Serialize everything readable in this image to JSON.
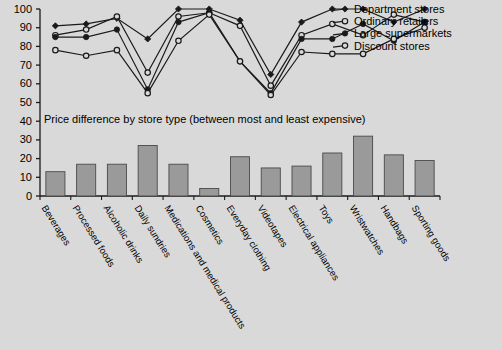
{
  "chart_data": {
    "type": "line",
    "title": "",
    "xlabel": "",
    "ylabel": "",
    "ylim": [
      0,
      100
    ],
    "yticks": [
      0,
      10,
      20,
      30,
      40,
      50,
      60,
      70,
      80,
      90,
      100
    ],
    "grid": false,
    "legend_position": "top-right",
    "categories": [
      "Beverages",
      "Processed foods",
      "Alcoholic drinks",
      "Daily sundries",
      "Medications and medical products",
      "Cosmetics",
      "Everyday clothing",
      "Videotapes",
      "Electrical appliances",
      "Toys",
      "Wristwatches",
      "Handbags",
      "Sporting goods"
    ],
    "series": [
      {
        "name": "Department stores",
        "marker": "filled-diamond",
        "values": [
          91,
          92,
          95,
          84,
          100,
          100,
          94,
          65,
          93,
          100,
          100,
          93,
          100
        ]
      },
      {
        "name": "Ordinary retailers",
        "marker": "open-circle",
        "values": [
          86,
          89,
          96,
          66,
          96,
          98,
          91,
          59,
          86,
          92,
          86,
          97,
          93
        ]
      },
      {
        "name": "Large supermarkets",
        "marker": "filled-circle",
        "values": [
          85,
          85,
          89,
          57,
          93,
          98,
          72,
          55,
          84,
          84,
          92,
          83,
          93
        ]
      },
      {
        "name": "Discount stores",
        "marker": "open-circle",
        "values": [
          78,
          75,
          78,
          55,
          83,
          97,
          72,
          54,
          77,
          76,
          76,
          84,
          90
        ]
      }
    ]
  },
  "bar_chart": {
    "type": "bar",
    "title": "Price difference by store type (between most and least expensive)",
    "ylim": [
      0,
      100
    ],
    "categories": [
      "Beverages",
      "Processed foods",
      "Alcoholic drinks",
      "Daily sundries",
      "Medications and medical products",
      "Cosmetics",
      "Everyday clothing",
      "Videotapes",
      "Electrical appliances",
      "Toys",
      "Wristwatches",
      "Handbags",
      "Sporting goods"
    ],
    "values": [
      13,
      17,
      17,
      27,
      17,
      4,
      21,
      15,
      16,
      23,
      32,
      22,
      19
    ]
  },
  "axis": {
    "ytick_labels": [
      "100",
      "90",
      "80",
      "70",
      "60",
      "50",
      "40",
      "30",
      "20",
      "10",
      "0"
    ]
  },
  "legend": {
    "items": [
      {
        "label": "Department stores",
        "marker": "filled-diamond"
      },
      {
        "label": "Ordinary retailers",
        "marker": "open-circle"
      },
      {
        "label": "Large supermarkets",
        "marker": "filled-circle"
      },
      {
        "label": "Discount stores",
        "marker": "open-circle"
      }
    ]
  },
  "colors": {
    "background": "#d9d9d9",
    "bar_fill": "#9a9a9a",
    "line": "#1a1a1a",
    "axis": "#1a1a1a",
    "text": "#000000"
  }
}
